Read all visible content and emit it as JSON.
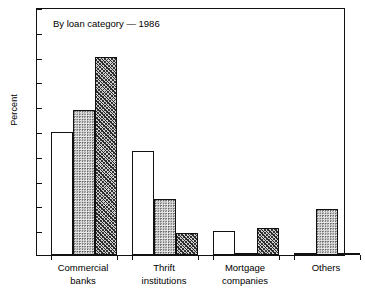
{
  "chart_data": {
    "type": "bar",
    "title": "",
    "annotation": "By loan category — 1986",
    "xlabel": "",
    "ylabel": "Percent",
    "ylim": [
      0,
      100
    ],
    "yticks": [
      0,
      10,
      20,
      30,
      40,
      50,
      60,
      70,
      80,
      90,
      100
    ],
    "grid": false,
    "legend": "none",
    "categories": [
      "Commercial\nbanks",
      "Thrift\ninstitutions",
      "Mortgage\ncompanies",
      "Others"
    ],
    "category_lines": [
      [
        "Commercial",
        "banks"
      ],
      [
        "Thrift",
        "institutions"
      ],
      [
        "Mortgage",
        "companies"
      ],
      [
        "Others",
        ""
      ]
    ],
    "series": [
      {
        "name": "series-1",
        "fill": "open",
        "values": [
          49.5,
          42.0,
          9.8,
          0.3
        ]
      },
      {
        "name": "series-2",
        "fill": "dot",
        "values": [
          58.5,
          22.5,
          1.0,
          18.7
        ]
      },
      {
        "name": "series-3",
        "fill": "hatch",
        "values": [
          80.0,
          9.0,
          10.7,
          0.7
        ]
      }
    ]
  },
  "colors": {
    "axis": "#111111",
    "open_fill": "#ffffff",
    "dot_fill": "#e9e9e9",
    "hatch_fill": "#cfcfcf",
    "background": "#ffffff"
  }
}
